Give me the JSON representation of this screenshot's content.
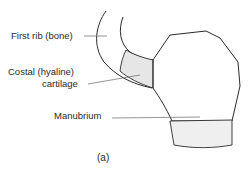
{
  "figure": {
    "labels": {
      "first_rib": "First rib (bone)",
      "costal_line1": "Costal (hyaline)",
      "costal_line2": "cartilage",
      "manubrium": "Manubrium"
    },
    "caption": "(a)",
    "colors": {
      "outline": "#2a2a2a",
      "leader": "#666666",
      "cartilage_fill": "#e6e6e6"
    }
  }
}
